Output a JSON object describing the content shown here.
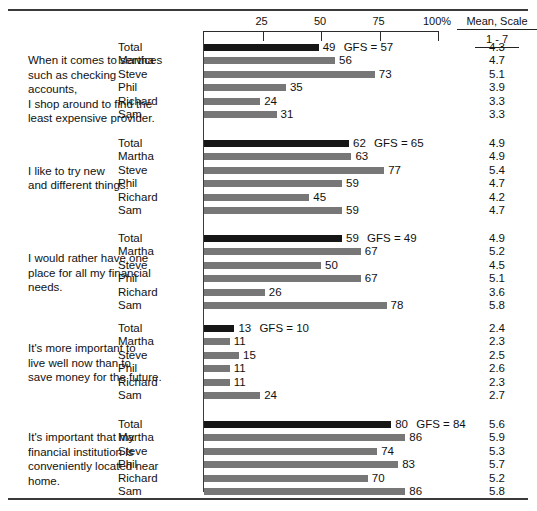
{
  "chart_data": {
    "type": "bar",
    "title": "",
    "xlabel": "",
    "ylabel": "",
    "xlim": [
      0,
      100
    ],
    "grid": false,
    "legend_position": "none",
    "axis": {
      "tick_labels": [
        "25",
        "50",
        "75",
        "100%"
      ],
      "tick_values": [
        25,
        50,
        75,
        100
      ],
      "start_value": 0,
      "end_value": 100
    },
    "right_column": {
      "header_line1": "Mean, Scale",
      "header_line2": "1 - 7"
    },
    "series_names": [
      "Total",
      "Martha",
      "Steve",
      "Phil",
      "Richard",
      "Sam"
    ],
    "gfs_label": "GFS",
    "gfs_equals": "=",
    "groups": [
      {
        "statement": "When it comes to services\nsuch as checking accounts,\nI shop around to find the\nleast expensive provider.",
        "gfs_value": 57,
        "rows": [
          {
            "label": "Total",
            "value": 49,
            "mean": "4.3",
            "is_total": true
          },
          {
            "label": "Martha",
            "value": 56,
            "mean": "4.7",
            "is_total": false
          },
          {
            "label": "Steve",
            "value": 73,
            "mean": "5.1",
            "is_total": false
          },
          {
            "label": "Phil",
            "value": 35,
            "mean": "3.9",
            "is_total": false
          },
          {
            "label": "Richard",
            "value": 24,
            "mean": "3.3",
            "is_total": false
          },
          {
            "label": "Sam",
            "value": 31,
            "mean": "3.3",
            "is_total": false
          }
        ]
      },
      {
        "statement": "I like to try new\nand different things.",
        "gfs_value": 65,
        "rows": [
          {
            "label": "Total",
            "value": 62,
            "mean": "4.9",
            "is_total": true
          },
          {
            "label": "Martha",
            "value": 63,
            "mean": "4.9",
            "is_total": false
          },
          {
            "label": "Steve",
            "value": 77,
            "mean": "5.4",
            "is_total": false
          },
          {
            "label": "Phil",
            "value": 59,
            "mean": "4.7",
            "is_total": false
          },
          {
            "label": "Richard",
            "value": 45,
            "mean": "4.2",
            "is_total": false
          },
          {
            "label": "Sam",
            "value": 59,
            "mean": "4.7",
            "is_total": false
          }
        ]
      },
      {
        "statement": "I would rather have one\nplace for all my financial\nneeds.",
        "gfs_value": 49,
        "rows": [
          {
            "label": "Total",
            "value": 59,
            "mean": "4.9",
            "is_total": true
          },
          {
            "label": "Martha",
            "value": 67,
            "mean": "5.2",
            "is_total": false
          },
          {
            "label": "Steve",
            "value": 50,
            "mean": "4.5",
            "is_total": false
          },
          {
            "label": "Phil",
            "value": 67,
            "mean": "5.1",
            "is_total": false
          },
          {
            "label": "Richard",
            "value": 26,
            "mean": "3.6",
            "is_total": false
          },
          {
            "label": "Sam",
            "value": 78,
            "mean": "5.8",
            "is_total": false
          }
        ]
      },
      {
        "statement": "It's more important to\nlive well now than to\nsave money for the future.",
        "gfs_value": 10,
        "rows": [
          {
            "label": "Total",
            "value": 13,
            "mean": "2.4",
            "is_total": true
          },
          {
            "label": "Martha",
            "value": 11,
            "mean": "2.3",
            "is_total": false
          },
          {
            "label": "Steve",
            "value": 15,
            "mean": "2.5",
            "is_total": false
          },
          {
            "label": "Phil",
            "value": 11,
            "mean": "2.6",
            "is_total": false
          },
          {
            "label": "Richard",
            "value": 11,
            "mean": "2.3",
            "is_total": false
          },
          {
            "label": "Sam",
            "value": 24,
            "mean": "2.7",
            "is_total": false
          }
        ]
      },
      {
        "statement": "It's important that my\nfinancial institution is\nconveniently located near\nhome.",
        "gfs_value": 84,
        "rows": [
          {
            "label": "Total",
            "value": 80,
            "mean": "5.6",
            "is_total": true
          },
          {
            "label": "Martha",
            "value": 86,
            "mean": "5.9",
            "is_total": false
          },
          {
            "label": "Steve",
            "value": 74,
            "mean": "5.3",
            "is_total": false
          },
          {
            "label": "Phil",
            "value": 83,
            "mean": "5.7",
            "is_total": false
          },
          {
            "label": "Richard",
            "value": 70,
            "mean": "5.2",
            "is_total": false
          },
          {
            "label": "Sam",
            "value": 86,
            "mean": "5.8",
            "is_total": false
          }
        ]
      }
    ],
    "colors": {
      "total_bar": "#161616",
      "member_bar": "#777777",
      "rule": "#3a3a3a",
      "text": "#111111"
    }
  }
}
